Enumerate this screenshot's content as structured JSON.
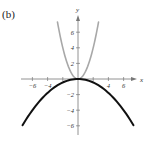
{
  "panel_label": "(b)",
  "chart_data": {
    "type": "line",
    "title": "",
    "xlabel": "x",
    "ylabel": "y",
    "xlim": [
      -7.5,
      7.5
    ],
    "ylim": [
      -6.5,
      7.5
    ],
    "grid": false,
    "legend": null,
    "x_ticks": [
      -6,
      -4,
      -2,
      2,
      4,
      6
    ],
    "x_tick_labels": [
      "-6",
      "-4",
      "4",
      "6"
    ],
    "y_ticks": [
      -6,
      -4,
      -2,
      2,
      4,
      6
    ],
    "y_tick_labels": [
      "-6",
      "-4",
      "-2",
      "2",
      "4",
      "6"
    ],
    "series": [
      {
        "name": "y = x^2",
        "color": "#a8a8a8",
        "x": [
          -2.7,
          -2.5,
          -2,
          -1.5,
          -1,
          -0.5,
          0,
          0.5,
          1,
          1.5,
          2,
          2.5,
          2.7
        ],
        "values": [
          7.29,
          6.25,
          4,
          2.25,
          1,
          0.25,
          0,
          0.25,
          1,
          2.25,
          4,
          6.25,
          7.29
        ]
      },
      {
        "name": "y = -x^2/9",
        "color": "#111111",
        "x": [
          -7.3,
          -6,
          -4,
          -2,
          0,
          2,
          4,
          6,
          7.3
        ],
        "values": [
          -5.92,
          -4,
          -1.78,
          -0.44,
          0,
          -0.44,
          -1.78,
          -4,
          -5.92
        ]
      }
    ]
  }
}
